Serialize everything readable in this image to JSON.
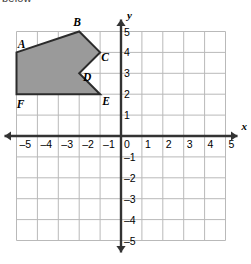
{
  "caption": {
    "fragment_text": "below"
  },
  "figure": {
    "name": "coordinate-plane-polygon",
    "colors": {
      "grid_line": "#b9b9b9",
      "axis_line": "#333333",
      "polygon_fill": "#9a9a9a",
      "polygon_stroke": "#2b2b2b",
      "text": "#000000"
    }
  },
  "chart_data": {
    "type": "scatter",
    "title": "",
    "xlabel": "x",
    "ylabel": "y",
    "xlim": [
      -5,
      5
    ],
    "ylim": [
      -5,
      5
    ],
    "grid": true,
    "legend": "none",
    "x_ticks": [
      -5,
      -4,
      -3,
      -2,
      -1,
      0,
      1,
      2,
      3,
      4,
      5
    ],
    "x_tick_labels": [
      "–5",
      "–4",
      "–3",
      "–2",
      "–1",
      "0",
      "1",
      "2",
      "3",
      "4",
      "5"
    ],
    "y_ticks": [
      -5,
      -4,
      -3,
      -2,
      -1,
      1,
      2,
      3,
      4,
      5
    ],
    "y_tick_labels": [
      "–5",
      "–4",
      "–3",
      "–2",
      "–1",
      "1",
      "2",
      "3",
      "4",
      "5"
    ],
    "axis_labels": {
      "x": "x",
      "y": "y"
    },
    "shapes": [
      {
        "name": "polygon-ABCDEF",
        "kind": "polygon",
        "closed": true,
        "fill": "#9a9a9a",
        "stroke": "#2b2b2b",
        "vertices": [
          {
            "label": "A",
            "x": -5,
            "y": 4,
            "label_dx": 5,
            "label_dy": -4
          },
          {
            "label": "B",
            "x": -2,
            "y": 5,
            "label_dx": -2,
            "label_dy": -6
          },
          {
            "label": "C",
            "x": -1,
            "y": 4,
            "label_dx": 5,
            "label_dy": 9
          },
          {
            "label": "D",
            "x": -2,
            "y": 3,
            "label_dx": 8,
            "label_dy": 8
          },
          {
            "label": "E",
            "x": -1,
            "y": 2,
            "label_dx": 6,
            "label_dy": 11
          },
          {
            "label": "F",
            "x": -5,
            "y": 2,
            "label_dx": 4,
            "label_dy": 14
          }
        ]
      }
    ]
  }
}
